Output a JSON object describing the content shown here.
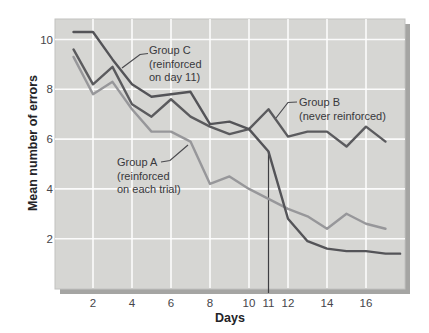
{
  "figure_title": "",
  "axes": {
    "y_title": "Mean number of errors",
    "x_title": "Days"
  },
  "chart_data": {
    "type": "line",
    "title": "",
    "xlabel": "Days",
    "ylabel": "Mean number of errors",
    "x": [
      1,
      2,
      3,
      4,
      5,
      6,
      7,
      8,
      9,
      10,
      11,
      12,
      13,
      14,
      15,
      16,
      17
    ],
    "x_tick_days": [
      2,
      4,
      6,
      8,
      10,
      11,
      12,
      14,
      16
    ],
    "x_tick_labels": [
      "2",
      "4",
      "6",
      "8",
      "10",
      "11",
      "12",
      "14",
      "16"
    ],
    "y_ticks": [
      2,
      4,
      6,
      8,
      10
    ],
    "y_tick_labels": [
      "2",
      "4",
      "6",
      "8",
      "10"
    ],
    "ylim": [
      0,
      10.8
    ],
    "xlim_days": [
      0.05,
      18.0
    ],
    "grid": "white gridlines at even days (vertical) and every 2 errors (horizontal) on gray panel",
    "legend_position": "annotated callouts on plot",
    "panel_color": "#d6d6d3",
    "gridline_color": "#ffffff",
    "series": [
      {
        "name": "Group A (reinforced on each trial)",
        "slug": "group-a",
        "color": "#97979a",
        "values": [
          9.3,
          7.8,
          8.3,
          7.2,
          6.3,
          6.3,
          5.9,
          4.2,
          4.5,
          4.0,
          3.6,
          3.2,
          2.9,
          2.4,
          3.0,
          2.6,
          2.4
        ]
      },
      {
        "name": "Group B (never reinforced)",
        "slug": "group-b",
        "color": "#5b5b5e",
        "values": [
          9.6,
          8.2,
          8.9,
          7.4,
          6.9,
          7.6,
          6.9,
          6.5,
          6.2,
          6.4,
          7.2,
          6.1,
          6.3,
          6.3,
          5.7,
          6.5,
          5.9
        ]
      },
      {
        "name": "Group C (reinforced on day 11)",
        "slug": "group-c",
        "color": "#545458",
        "values": [
          10.3,
          10.3,
          9.2,
          8.2,
          7.7,
          7.8,
          7.9,
          6.6,
          6.7,
          6.4,
          5.5,
          2.8,
          1.9,
          1.6,
          1.5,
          1.5,
          1.4
        ],
        "extends_to_day": 17.75
      }
    ],
    "day11_marker": {
      "day": 11,
      "series": "group-c",
      "line_color": "#3f3f43"
    }
  },
  "annotations": {
    "group_c": {
      "line1": "Group C",
      "line2": "(reinforced",
      "line3": "on day 11)"
    },
    "group_b": {
      "line1": "Group B",
      "line2": "(never reinforced)"
    },
    "group_a": {
      "line1": "Group A",
      "line2": "(reinforced",
      "line3": "on each trial)"
    }
  }
}
